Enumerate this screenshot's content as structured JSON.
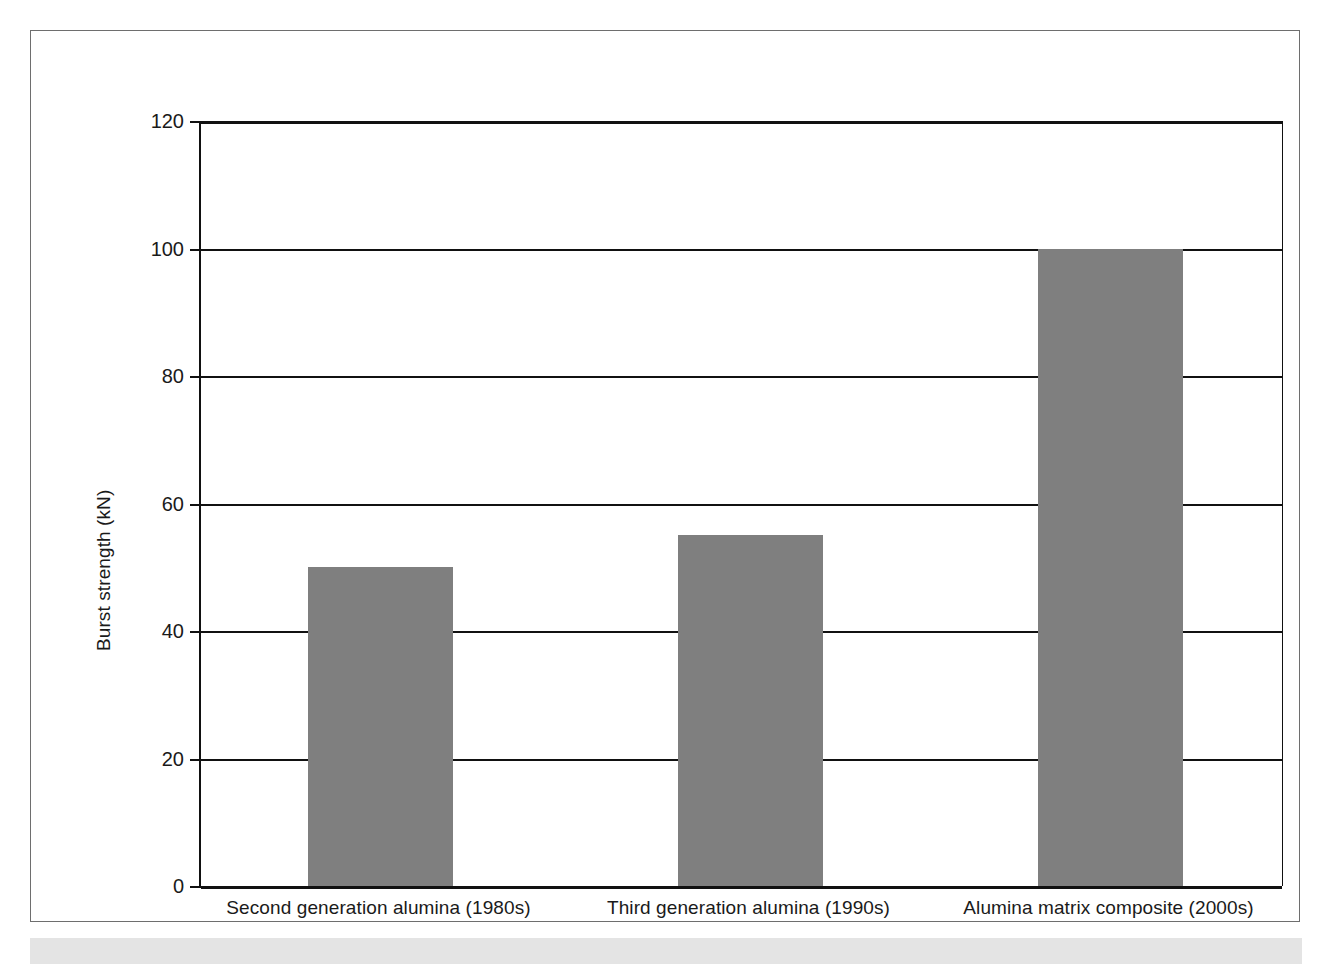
{
  "chart_data": {
    "type": "bar",
    "title": "",
    "xlabel": "",
    "ylabel": "Burst strength (kN)",
    "categories": [
      "Second generation alumina (1980s)",
      "Third generation alumina (1990s)",
      "Alumina matrix composite (2000s)"
    ],
    "values": [
      50,
      55,
      100
    ],
    "ylim": [
      0,
      120
    ],
    "yticks": [
      0,
      20,
      40,
      60,
      80,
      100,
      120
    ],
    "ytick_labels": [
      "0",
      "20",
      "40",
      "60",
      "80",
      "100",
      "120"
    ],
    "grid": "horizontal",
    "legend": "none",
    "bar_color": "#7f7f7f",
    "axis_color": "#111111",
    "frame_color": "#6e6e6e"
  }
}
